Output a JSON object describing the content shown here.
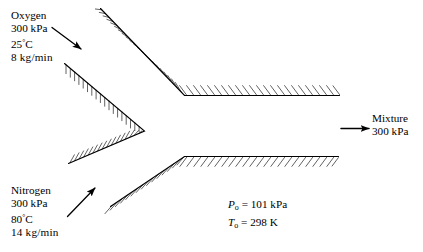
{
  "diagram": {
    "stream_in_top": {
      "name": "Oxygen",
      "pressure": "300 kPa",
      "temperature_value": "25",
      "temperature_unit": "C",
      "flow_rate": "8 kg/min"
    },
    "stream_in_bottom": {
      "name": "Nitrogen",
      "pressure": "300 kPa",
      "temperature_value": "80",
      "temperature_unit": "C",
      "flow_rate": "14 kg/min"
    },
    "stream_out": {
      "name": "Mixture",
      "pressure": "300 kPa"
    },
    "dead_state": {
      "pressure_symbol": "P",
      "pressure_subscript": "o",
      "pressure_equals": "= 101 kPa",
      "temperature_symbol": "T",
      "temperature_subscript": "o",
      "temperature_equals": "= 298 K"
    },
    "colors": {
      "stroke": "#000000",
      "background": "#ffffff"
    }
  }
}
